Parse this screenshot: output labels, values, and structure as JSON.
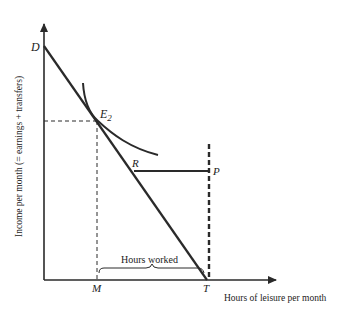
{
  "diagram": {
    "type": "labor-supply budget constraint with transfer",
    "axes": {
      "y_label": "Income per month (= earnings + transfers)",
      "x_label": "Hours of leisure per month"
    },
    "points": {
      "D": "D",
      "E2_main": "E",
      "E2_sub": "2",
      "R": "R",
      "P": "P",
      "M": "M",
      "T": "T"
    },
    "annotations": {
      "hours_worked": "Hours worked"
    },
    "colors": {
      "line": "#2a2a2a",
      "background": "#ffffff"
    }
  }
}
